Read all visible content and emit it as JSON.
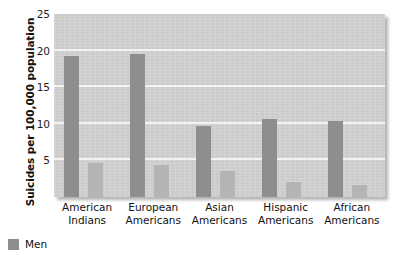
{
  "chart_data": {
    "type": "bar",
    "title": "",
    "xlabel": "",
    "ylabel": "Suicides per 100,000 population",
    "categories": [
      "American Indians",
      "European Americans",
      "Asian Americans",
      "Hispanic Americans",
      "African Americans"
    ],
    "category_lines": [
      [
        "American",
        "Indians"
      ],
      [
        "European",
        "Americans"
      ],
      [
        "Asian",
        "Americans"
      ],
      [
        "Hispanic",
        "Americans"
      ],
      [
        "African",
        "Americans"
      ]
    ],
    "series": [
      {
        "name": "Men",
        "color": "#8e8e8e",
        "values": [
          19.2,
          19.5,
          9.7,
          10.6,
          10.4
        ]
      },
      {
        "name": "Women",
        "color": "#b4b4b4",
        "values": [
          4.7,
          4.4,
          3.6,
          2.0,
          1.7
        ]
      }
    ],
    "ylim": [
      0,
      25
    ],
    "yticks": [
      5,
      10,
      15,
      20,
      25
    ],
    "ytick_labels": [
      "5",
      "10",
      "15",
      "20",
      "25"
    ],
    "grid": true,
    "grid_color": "#f3f3f3",
    "plot_background": "#d2d2d2",
    "legend": {
      "position": "below-left",
      "entries": [
        {
          "label": "Men",
          "color": "#8e8e8e"
        }
      ]
    }
  }
}
